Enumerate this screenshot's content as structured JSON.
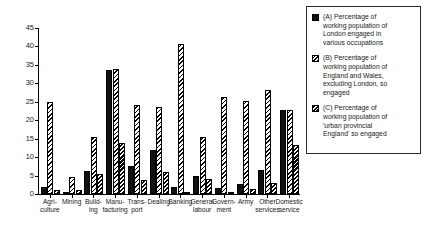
{
  "chart_data": {
    "type": "bar",
    "title": "",
    "subtitle": "",
    "xlabel": "",
    "ylabel": "",
    "ylim": [
      0,
      45
    ],
    "yticks": [
      0,
      5,
      10,
      15,
      20,
      25,
      30,
      35,
      40,
      45
    ],
    "grid": false,
    "legend_position": "right",
    "categories": [
      "Agri-\nculture",
      "Mining",
      "Build-\ning",
      "Manu-\nfacturing",
      "Trans-\nport",
      "Dealing",
      "Banking",
      "General\nlabour",
      "Govern-\nment",
      "Army",
      "Other\nservices",
      "Domestic\nservice"
    ],
    "series": [
      {
        "name": "(A)",
        "fill": "solid-black",
        "values": [
          2.0,
          0.3,
          6.3,
          33.5,
          7.7,
          11.8,
          1.9,
          4.8,
          1.5,
          2.6,
          6.4,
          22.8
        ]
      },
      {
        "name": "(B)",
        "fill": "light-diagonal-hatch",
        "values": [
          24.9,
          4.6,
          15.4,
          34.0,
          24.2,
          23.6,
          40.7,
          15.5,
          26.2,
          25.2,
          28.2,
          22.8
        ]
      },
      {
        "name": "(C)",
        "fill": "dense-diagonal-hatch",
        "values": [
          1.0,
          1.2,
          5.4,
          13.8,
          3.7,
          6.0,
          0.5,
          4.2,
          0.6,
          1.4,
          2.9,
          13.2
        ]
      }
    ]
  },
  "legend": {
    "entries": [
      {
        "key": "A",
        "label": "(A)  Percentage of\nworking population of\nLondon engaged in\nvarious occupations"
      },
      {
        "key": "B",
        "label": "(B)  Percentage of\nworking population of\nEngland and Wales,\nexcluding London, so\nengaged"
      },
      {
        "key": "C",
        "label": "(C)  Percentage of\nworking population of\n'urban provincial\nEngland' so engaged"
      }
    ]
  },
  "colors": {
    "series_a": "#111111",
    "hatch": "#000000",
    "axis": "#000000",
    "background": "#ffffff"
  }
}
